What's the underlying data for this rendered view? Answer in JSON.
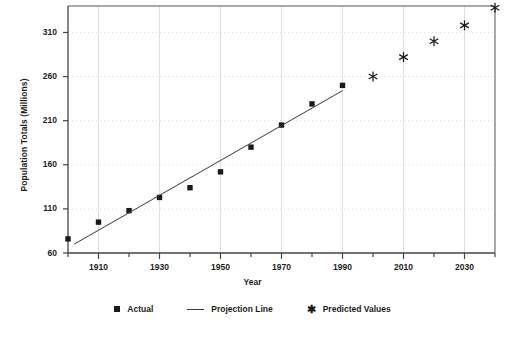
{
  "chart_data": {
    "type": "scatter",
    "title": "",
    "xlabel": "Year",
    "ylabel": "Population Totals (Millions)",
    "xlim": [
      1900,
      2040
    ],
    "ylim": [
      60,
      340
    ],
    "grid": true,
    "legend_position": "bottom",
    "x_ticks": [
      1900,
      1910,
      1920,
      1930,
      1940,
      1950,
      1960,
      1970,
      1980,
      1990,
      2000,
      2010,
      2020,
      2030,
      2040
    ],
    "x_tick_labels": [
      "",
      "1910",
      "",
      "1930",
      "",
      "1950",
      "",
      "1970",
      "",
      "1990",
      "",
      "2010",
      "",
      "2030",
      ""
    ],
    "y_ticks": [
      60,
      110,
      160,
      210,
      260,
      310
    ],
    "y_tick_labels": [
      "60",
      "110",
      "160",
      "210",
      "260",
      "310"
    ],
    "series": [
      {
        "name": "Actual",
        "marker": "square",
        "x": [
          1900,
          1910,
          1920,
          1930,
          1940,
          1950,
          1960,
          1970,
          1980,
          1990
        ],
        "values": [
          76,
          95,
          108,
          123,
          134,
          152,
          180,
          205,
          229,
          250
        ]
      },
      {
        "name": "Projection Line",
        "marker": "line",
        "x": [
          1902,
          1990
        ],
        "values": [
          70,
          244
        ]
      },
      {
        "name": "Predicted Values",
        "marker": "asterisk",
        "x": [
          2000,
          2010,
          2020,
          2030,
          2040
        ],
        "values": [
          260,
          282,
          300,
          318,
          338
        ]
      }
    ]
  },
  "axes": {
    "y_title": "Population Totals (Millions)",
    "x_title": "Year"
  },
  "legend": {
    "items": [
      {
        "label": "Actual",
        "marker": "square-marker"
      },
      {
        "label": "Projection Line",
        "marker": "line-marker"
      },
      {
        "label": "Predicted Values",
        "marker": "asterisk-marker"
      }
    ]
  },
  "colors": {
    "marker": "#1a1a1a",
    "line": "#3a3a3a",
    "axis": "#555555",
    "grid": "#c9c9c9",
    "text": "#1c1c1c",
    "background": "#ffffff"
  }
}
